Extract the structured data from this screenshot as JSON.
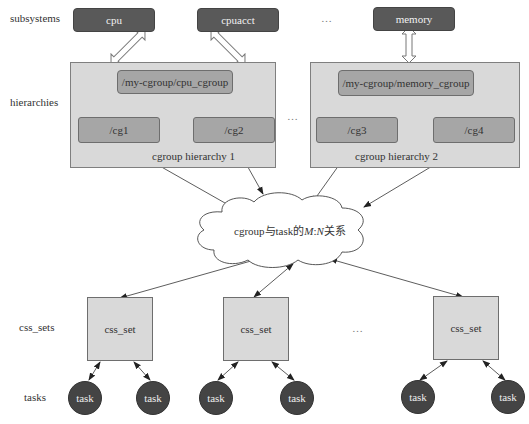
{
  "rows": {
    "subsystems": "subsystems",
    "hierarchies": "hierarchies",
    "css_sets": "css_sets",
    "tasks": "tasks"
  },
  "subsystems": [
    {
      "label": "cpu"
    },
    {
      "label": "cpuacct"
    },
    {
      "label": "memory"
    }
  ],
  "ellipsis": "…",
  "hierarchies": [
    {
      "root": "/my-cgroup/cpu_cgroup",
      "children": [
        "/cg1",
        "/cg2"
      ],
      "label": "cgroup hierarchy 1"
    },
    {
      "root": "/my-cgroup/memory_cgroup",
      "children": [
        "/cg3",
        "/cg4"
      ],
      "label": "cgroup hierarchy 2"
    }
  ],
  "cloud": {
    "prefix": "cgroup与task的",
    "m": "M",
    "colon": ":",
    "n": "N",
    "suffix": "关系"
  },
  "css_sets": [
    {
      "label": "css_set"
    },
    {
      "label": "css_set"
    },
    {
      "label": "css_set"
    }
  ],
  "tasks": [
    {
      "label": "task"
    },
    {
      "label": "task"
    },
    {
      "label": "task"
    },
    {
      "label": "task"
    },
    {
      "label": "task"
    },
    {
      "label": "task"
    }
  ],
  "colors": {
    "subsystem_fill": "#595959",
    "hierarchy_fill": "#d9d9d9",
    "cgroup_fill": "#a6a6a6",
    "css_set_fill": "#d9d9d9",
    "task_fill": "#444444"
  }
}
